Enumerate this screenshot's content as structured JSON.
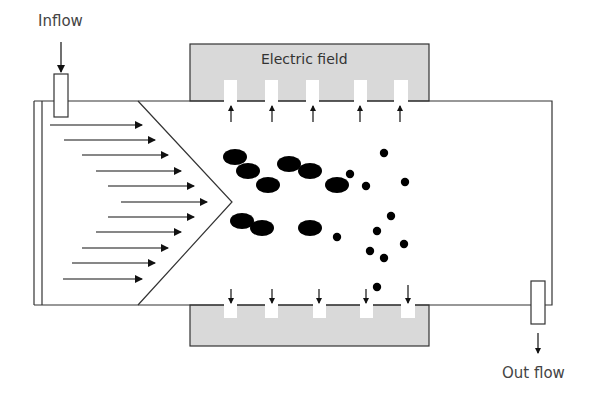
{
  "labels": {
    "inflow": "Inflow",
    "electric_field": "Electric field",
    "outflow": "Out flow"
  },
  "colors": {
    "electrode_fill": "#d9d9d9",
    "line": "#333333",
    "particle": "#000000"
  },
  "diagram": {
    "channel": {
      "x": 34,
      "y": 101,
      "w": 518,
      "h": 204
    },
    "top_electrode": {
      "x": 190,
      "y": 44,
      "w": 239,
      "h": 57
    },
    "bottom_electrode": {
      "x": 190,
      "y": 305,
      "w": 239,
      "h": 41
    },
    "slot_x": [
      224,
      265,
      306,
      354,
      395
    ],
    "flow_arrows_count": 11,
    "large_particles": 9,
    "small_particles": 13
  }
}
